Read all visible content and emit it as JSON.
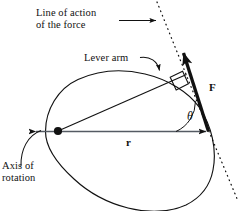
{
  "figure": {
    "background_color": "#ffffff",
    "stroke_color": "#111111",
    "width": 243,
    "height": 211,
    "labels": {
      "line_of_action": "Line of action\nof the force",
      "lever_arm": "Lever arm",
      "axis_of_rotation": "Axis of\nrotation",
      "force": "F",
      "radius": "r",
      "theta": "θ"
    },
    "elements": {
      "body_outline": "rigid-body-blob",
      "pivot_point": "axis-of-rotation-dot",
      "force_vector": "force-arrow",
      "line_of_action": "dotted-line-of-action",
      "lever_arm_line": "perpendicular-lever-arm",
      "right_angle_mark": "right-angle-square",
      "radius_vector": "r-double-arrow",
      "angle_arc": "theta-arc"
    }
  }
}
